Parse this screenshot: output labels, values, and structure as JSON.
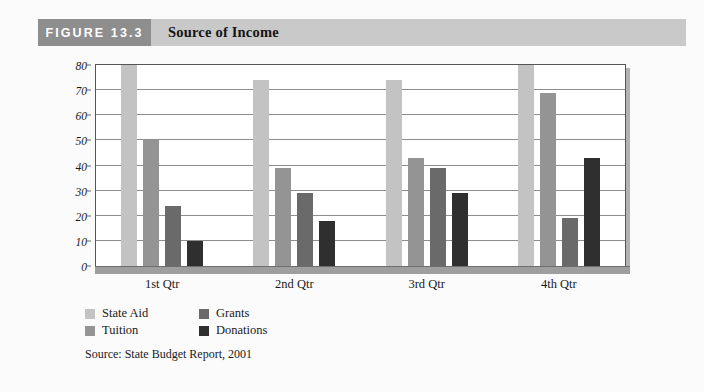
{
  "header": {
    "figure_tag": "FIGURE 13.3",
    "title": "Source of Income"
  },
  "source_note": "Source: State Budget Report, 2001",
  "colors": {
    "state_aid": "#c3c3c3",
    "tuition": "#949494",
    "grants": "#6a6a6a",
    "donations": "#2f2f2f",
    "header_tag_bg": "#8e8e8e",
    "header_bar_bg": "#c9c9c9",
    "plot_border": "#555555",
    "gridline": "#8d8d8d",
    "floor": "#9e9e9e"
  },
  "chart_data": {
    "type": "bar",
    "title": "Source of Income",
    "xlabel": "",
    "ylabel": "",
    "ylim": [
      0,
      80
    ],
    "yticks": [
      0,
      10,
      20,
      30,
      40,
      50,
      60,
      70,
      80
    ],
    "grid": true,
    "legend_position": "bottom-left",
    "categories": [
      "1st Qtr",
      "2nd Qtr",
      "3rd Qtr",
      "4th Qtr"
    ],
    "series": [
      {
        "name": "State Aid",
        "color": "#c3c3c3",
        "values": [
          80,
          74,
          74,
          80
        ]
      },
      {
        "name": "Tuition",
        "color": "#949494",
        "values": [
          50,
          39,
          43,
          69
        ]
      },
      {
        "name": "Grants",
        "color": "#6a6a6a",
        "values": [
          24,
          29,
          39,
          19
        ]
      },
      {
        "name": "Donations",
        "color": "#2f2f2f",
        "values": [
          10,
          18,
          29,
          43
        ]
      }
    ]
  }
}
